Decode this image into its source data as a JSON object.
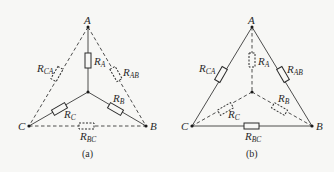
{
  "figure": {
    "panels": [
      {
        "id": "a",
        "caption": "(a)",
        "description": "Star (Y) connection solid, delta connection dashed",
        "nodes": {
          "A": "A",
          "B": "B",
          "C": "C"
        },
        "resistors": {
          "RA": {
            "main": "R",
            "sub": "A",
            "style": "solid"
          },
          "RB": {
            "main": "R",
            "sub": "B",
            "style": "solid"
          },
          "RC": {
            "main": "R",
            "sub": "C",
            "style": "solid"
          },
          "RAB": {
            "main": "R",
            "sub": "AB",
            "style": "dashed"
          },
          "RBC": {
            "main": "R",
            "sub": "BC",
            "style": "dashed"
          },
          "RCA": {
            "main": "R",
            "sub": "CA",
            "style": "dashed"
          }
        }
      },
      {
        "id": "b",
        "caption": "(b)",
        "description": "Delta connection solid, star (Y) connection dashed",
        "nodes": {
          "A": "A",
          "B": "B",
          "C": "C"
        },
        "resistors": {
          "RA": {
            "main": "R",
            "sub": "A",
            "style": "dashed"
          },
          "RB": {
            "main": "R",
            "sub": "B",
            "style": "dashed"
          },
          "RC": {
            "main": "R",
            "sub": "C",
            "style": "dashed"
          },
          "RAB": {
            "main": "R",
            "sub": "AB",
            "style": "solid"
          },
          "RBC": {
            "main": "R",
            "sub": "BC",
            "style": "solid"
          },
          "RCA": {
            "main": "R",
            "sub": "CA",
            "style": "solid"
          }
        }
      }
    ]
  }
}
